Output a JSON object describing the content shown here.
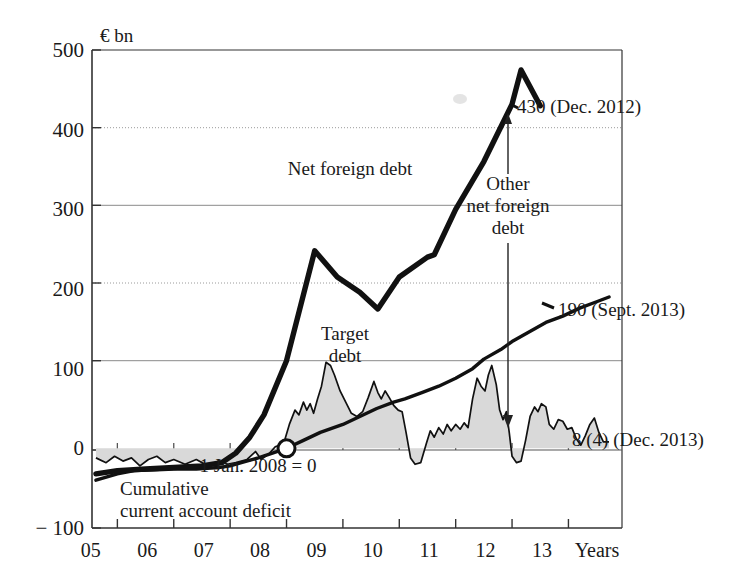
{
  "chart_data": {
    "type": "line",
    "title": "",
    "subtitle": "",
    "xlabel": "Years",
    "ylabel": "€ bn",
    "xlim": [
      2004.55,
      2013.95
    ],
    "ylim": [
      -100,
      500
    ],
    "grid": true,
    "legend_position": "inline-annotations",
    "yticks": [
      -100,
      0,
      100,
      200,
      300,
      400,
      500
    ],
    "ytick_labels": [
      "− 100",
      "0",
      "100",
      "200",
      "300",
      "400",
      "500"
    ],
    "xticks": [
      2005,
      2006,
      2007,
      2008,
      2009,
      2010,
      2011,
      2012,
      2013
    ],
    "xtick_labels": [
      "05",
      "06",
      "07",
      "08",
      "09",
      "10",
      "11",
      "12",
      "13"
    ],
    "series": [
      {
        "name": "Net foreign debt",
        "style": "thick-line",
        "end_value": 430,
        "end_label": "430 (Dec. 2012)",
        "points": [
          [
            2004.62,
            -32
          ],
          [
            2005.0,
            -28
          ],
          [
            2005.5,
            -26
          ],
          [
            2006.0,
            -24
          ],
          [
            2006.5,
            -22
          ],
          [
            2006.85,
            -18
          ],
          [
            2007.1,
            -6
          ],
          [
            2007.35,
            14
          ],
          [
            2007.6,
            42
          ],
          [
            2008.0,
            110
          ],
          [
            2008.5,
            248
          ],
          [
            2008.9,
            215
          ],
          [
            2009.3,
            196
          ],
          [
            2009.62,
            175
          ],
          [
            2010.0,
            215
          ],
          [
            2010.5,
            240
          ],
          [
            2010.62,
            243
          ],
          [
            2011.0,
            300
          ],
          [
            2011.5,
            360
          ],
          [
            2012.0,
            432
          ],
          [
            2012.16,
            475
          ],
          [
            2012.5,
            430
          ]
        ]
      },
      {
        "name": "Cumulative current account deficit",
        "style": "medium-line",
        "end_value": 190,
        "end_label": "190 (Sept. 2013)",
        "zero_marker_label": "1 Jan. 2008 = 0",
        "zero_marker_x": 2008.0,
        "points": [
          [
            2004.62,
            -40
          ],
          [
            2005.0,
            -32
          ],
          [
            2005.3,
            -28
          ],
          [
            2005.7,
            -27
          ],
          [
            2006.0,
            -26
          ],
          [
            2006.4,
            -26
          ],
          [
            2006.8,
            -24
          ],
          [
            2007.0,
            -22
          ],
          [
            2007.2,
            -18
          ],
          [
            2007.5,
            -12
          ],
          [
            2007.75,
            -6
          ],
          [
            2008.0,
            0
          ],
          [
            2008.3,
            10
          ],
          [
            2008.6,
            20
          ],
          [
            2009.0,
            30
          ],
          [
            2009.3,
            40
          ],
          [
            2009.6,
            50
          ],
          [
            2009.9,
            58
          ],
          [
            2010.1,
            62
          ],
          [
            2010.4,
            70
          ],
          [
            2010.7,
            78
          ],
          [
            2011.0,
            88
          ],
          [
            2011.3,
            100
          ],
          [
            2011.5,
            112
          ],
          [
            2011.8,
            124
          ],
          [
            2012.0,
            134
          ],
          [
            2012.3,
            146
          ],
          [
            2012.6,
            158
          ],
          [
            2012.9,
            166
          ],
          [
            2013.2,
            176
          ],
          [
            2013.5,
            184
          ],
          [
            2013.72,
            190
          ]
        ]
      },
      {
        "name": "Target debt",
        "style": "thin-line-filled",
        "fill": "#d9d9d9",
        "end_value": 8,
        "end_label": "8 (4) (Dec. 2013)",
        "points": [
          [
            2004.62,
            -12
          ],
          [
            2004.8,
            -18
          ],
          [
            2004.95,
            -10
          ],
          [
            2005.1,
            -16
          ],
          [
            2005.25,
            -12
          ],
          [
            2005.4,
            -22
          ],
          [
            2005.55,
            -14
          ],
          [
            2005.7,
            -10
          ],
          [
            2005.85,
            -18
          ],
          [
            2006.0,
            -14
          ],
          [
            2006.2,
            -20
          ],
          [
            2006.4,
            -14
          ],
          [
            2006.6,
            -22
          ],
          [
            2006.8,
            -16
          ],
          [
            2006.95,
            -20
          ],
          [
            2007.1,
            -18
          ],
          [
            2007.3,
            -14
          ],
          [
            2007.45,
            -4
          ],
          [
            2007.55,
            -14
          ],
          [
            2007.7,
            -6
          ],
          [
            2007.8,
            2
          ],
          [
            2007.95,
            6
          ],
          [
            2008.05,
            30
          ],
          [
            2008.15,
            48
          ],
          [
            2008.22,
            42
          ],
          [
            2008.3,
            58
          ],
          [
            2008.36,
            48
          ],
          [
            2008.42,
            56
          ],
          [
            2008.48,
            44
          ],
          [
            2008.55,
            62
          ],
          [
            2008.62,
            78
          ],
          [
            2008.7,
            108
          ],
          [
            2008.78,
            104
          ],
          [
            2008.85,
            92
          ],
          [
            2008.95,
            72
          ],
          [
            2009.05,
            58
          ],
          [
            2009.15,
            44
          ],
          [
            2009.25,
            40
          ],
          [
            2009.35,
            46
          ],
          [
            2009.45,
            64
          ],
          [
            2009.55,
            84
          ],
          [
            2009.62,
            70
          ],
          [
            2009.68,
            62
          ],
          [
            2009.75,
            72
          ],
          [
            2009.82,
            64
          ],
          [
            2009.9,
            54
          ],
          [
            2009.98,
            48
          ],
          [
            2010.05,
            46
          ],
          [
            2010.12,
            20
          ],
          [
            2010.2,
            -12
          ],
          [
            2010.28,
            -20
          ],
          [
            2010.38,
            -18
          ],
          [
            2010.48,
            6
          ],
          [
            2010.55,
            22
          ],
          [
            2010.62,
            14
          ],
          [
            2010.7,
            26
          ],
          [
            2010.78,
            18
          ],
          [
            2010.85,
            30
          ],
          [
            2010.92,
            22
          ],
          [
            2011.0,
            30
          ],
          [
            2011.08,
            24
          ],
          [
            2011.15,
            32
          ],
          [
            2011.22,
            26
          ],
          [
            2011.3,
            62
          ],
          [
            2011.38,
            88
          ],
          [
            2011.45,
            78
          ],
          [
            2011.52,
            72
          ],
          [
            2011.58,
            92
          ],
          [
            2011.64,
            104
          ],
          [
            2011.72,
            80
          ],
          [
            2011.78,
            48
          ],
          [
            2011.84,
            36
          ],
          [
            2011.9,
            46
          ],
          [
            2011.95,
            20
          ],
          [
            2012.0,
            -10
          ],
          [
            2012.08,
            -18
          ],
          [
            2012.16,
            -16
          ],
          [
            2012.24,
            10
          ],
          [
            2012.32,
            40
          ],
          [
            2012.4,
            52
          ],
          [
            2012.46,
            46
          ],
          [
            2012.52,
            56
          ],
          [
            2012.6,
            52
          ],
          [
            2012.66,
            30
          ],
          [
            2012.74,
            24
          ],
          [
            2012.82,
            36
          ],
          [
            2012.9,
            34
          ],
          [
            2012.98,
            24
          ],
          [
            2013.06,
            26
          ],
          [
            2013.14,
            12
          ],
          [
            2013.22,
            4
          ],
          [
            2013.3,
            16
          ],
          [
            2013.38,
            30
          ],
          [
            2013.46,
            38
          ],
          [
            2013.54,
            20
          ],
          [
            2013.62,
            8
          ],
          [
            2013.72,
            8
          ]
        ]
      }
    ],
    "annotations": [
      {
        "id": "net-foreign-debt-label",
        "text": "Net foreign debt",
        "x": 350,
        "y": 175
      },
      {
        "id": "other-net-foreign-debt-label-1",
        "text": "Other",
        "x": 508,
        "y": 190
      },
      {
        "id": "other-net-foreign-debt-label-2",
        "text": "net foreign",
        "x": 508,
        "y": 212
      },
      {
        "id": "other-net-foreign-debt-label-3",
        "text": "debt",
        "x": 508,
        "y": 234
      },
      {
        "id": "target-debt-label-1",
        "text": "Target",
        "x": 345,
        "y": 340
      },
      {
        "id": "target-debt-label-2",
        "text": "debt",
        "x": 345,
        "y": 362
      },
      {
        "id": "zero-marker-label",
        "text": "1 Jan. 2008 = 0",
        "x": 258,
        "y": 472
      },
      {
        "id": "cumulative-label-1",
        "text": "Cumulative",
        "x": 120,
        "y": 495
      },
      {
        "id": "cumulative-label-2",
        "text": "current account deficit",
        "x": 120,
        "y": 517
      },
      {
        "id": "value-430",
        "text": "430 (Dec. 2012)",
        "x": 517,
        "y": 113
      },
      {
        "id": "value-190",
        "text": "190 (Sept. 2013)",
        "x": 558,
        "y": 316
      },
      {
        "id": "value-8",
        "text": "8 (4) (Dec. 2013)",
        "x": 572,
        "y": 446
      }
    ],
    "colors": {
      "line": "#111111",
      "fill": "#d9d9d9",
      "grid": "#8a8a8a",
      "axis": "#333333"
    }
  }
}
